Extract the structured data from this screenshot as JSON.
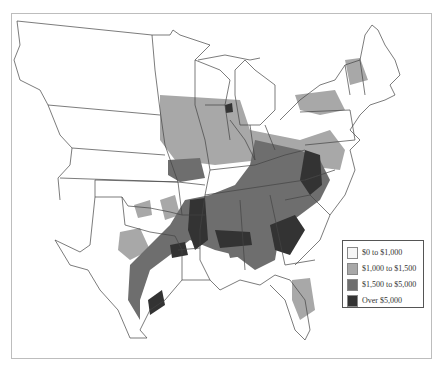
{
  "map": {
    "subject": "County-level values, eastern and central United States",
    "legend": {
      "items": [
        {
          "label": "$0 to $1,000",
          "color": "#f6f6f6"
        },
        {
          "label": "$1,000 to $1,500",
          "color": "#a8a8a8"
        },
        {
          "label": "$1,500 to $5,000",
          "color": "#6e6e6e"
        },
        {
          "label": "Over $5,000",
          "color": "#333333"
        }
      ]
    },
    "colors": {
      "outline": "#444444",
      "frame": "#bdbdbd",
      "background": "#ffffff"
    }
  }
}
